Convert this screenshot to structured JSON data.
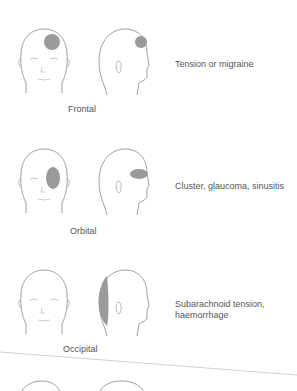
{
  "figure": {
    "rows": [
      {
        "region": "Frontal",
        "cause_lines": [
          "Tension or migraine"
        ],
        "pain_front": "forehead",
        "pain_side": "forehead"
      },
      {
        "region": "Orbital",
        "cause_lines": [
          "Cluster, glaucoma, sinusitis"
        ],
        "pain_front": "eye",
        "pain_side": "eye"
      },
      {
        "region": "Occipital",
        "cause_lines": [
          "Subarachnoid tension,",
          "haemorrhage"
        ],
        "pain_front": "none",
        "pain_side": "back"
      }
    ],
    "colors": {
      "outline": "#8a8a8a",
      "pain": "#9a9a9a",
      "text": "#555555"
    }
  }
}
